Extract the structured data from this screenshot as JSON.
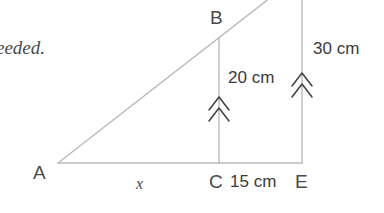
{
  "figure": {
    "type": "geometry-diagram",
    "stroke_color": "#b9b9b9",
    "mark_color": "#3f3f3f",
    "text_color": "#3a3a3a",
    "background": "#ffffff",
    "vertices": [
      {
        "name": "A",
        "label": "A",
        "x": 58,
        "y": 163
      },
      {
        "name": "B",
        "label": "B",
        "x": 219,
        "y": 38
      },
      {
        "name": "C",
        "label": "C",
        "x": 219,
        "y": 163
      },
      {
        "name": "E",
        "label": "E",
        "x": 302,
        "y": 163
      }
    ],
    "labels": {
      "A": "A",
      "B": "B",
      "C": "C",
      "E": "E"
    },
    "measures": {
      "base_AC": "x",
      "segment_CE": "15 cm",
      "height_BC": "20 cm",
      "height_DE": "30 cm"
    },
    "parallel_marks": {
      "count": 2,
      "glyph": "double-chevron",
      "on_segments": [
        "BC",
        "DE"
      ]
    },
    "cropped_text": "eeded."
  }
}
